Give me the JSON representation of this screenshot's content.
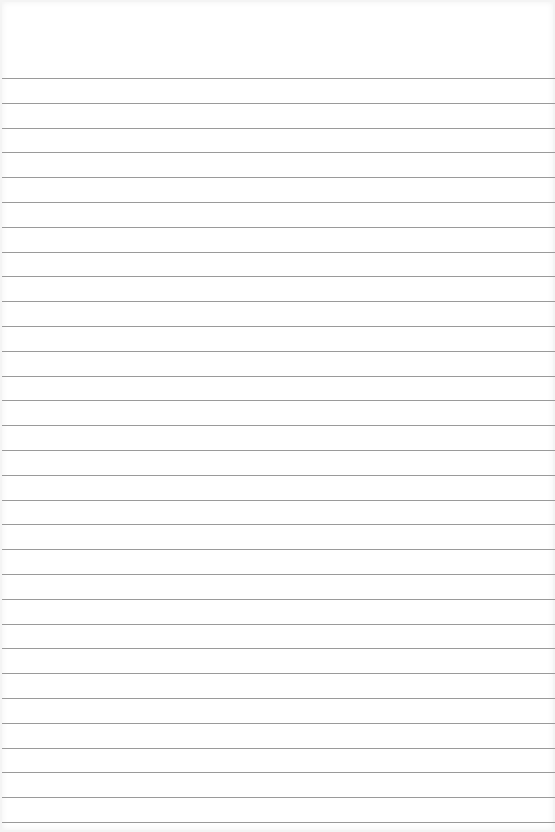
{
  "page": {
    "type": "blank lined paper",
    "line_count": 31,
    "first_line_y": 78,
    "line_spacing": 24.8,
    "line_color": "#9a9a9a",
    "paper_color": "#ffffff"
  }
}
